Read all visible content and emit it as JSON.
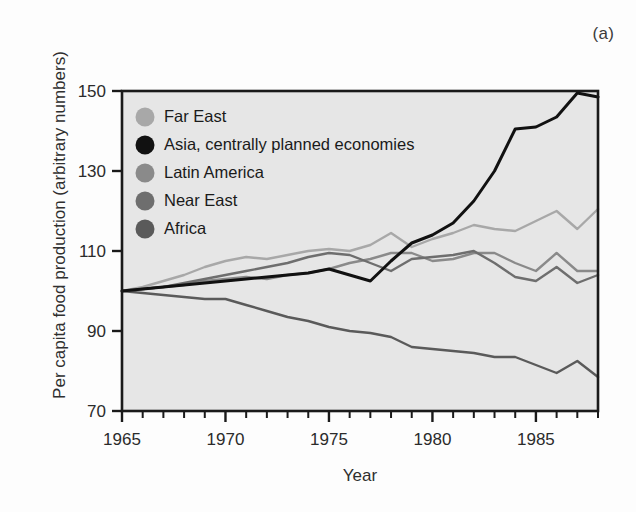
{
  "figure": {
    "panel_label": "(a)",
    "background_color": "#fdfdfd",
    "plot_background_color": "#e6e6e6",
    "axis_color": "#1a1a1a"
  },
  "chart_data": {
    "type": "line",
    "title": "",
    "subtitle": "",
    "xlabel": "Year",
    "ylabel": "Per capita food production (arbitrary numbers)",
    "xlim": [
      1965,
      1988
    ],
    "ylim": [
      70,
      150
    ],
    "xticks": [
      1965,
      1966,
      1967,
      1968,
      1969,
      1970,
      1971,
      1972,
      1973,
      1974,
      1975,
      1976,
      1977,
      1978,
      1979,
      1980,
      1981,
      1982,
      1983,
      1984,
      1985,
      1986,
      1987,
      1988
    ],
    "xtick_labels": [
      "1965",
      "",
      "",
      "",
      "",
      "1970",
      "",
      "",
      "",
      "",
      "1975",
      "",
      "",
      "",
      "",
      "1980",
      "",
      "",
      "",
      "",
      "1985",
      "",
      "",
      ""
    ],
    "xtick_labeled": [
      1965,
      1970,
      1975,
      1980,
      1985
    ],
    "yticks": [
      70,
      90,
      110,
      130,
      150
    ],
    "ytick_labels": [
      "70",
      "90",
      "110",
      "130",
      "150"
    ],
    "grid": false,
    "legend_position": "top-left",
    "x": [
      1965,
      1966,
      1967,
      1968,
      1969,
      1970,
      1971,
      1972,
      1973,
      1974,
      1975,
      1976,
      1977,
      1978,
      1979,
      1980,
      1981,
      1982,
      1983,
      1984,
      1985,
      1986,
      1987,
      1988
    ],
    "series": [
      {
        "name": "Far East",
        "color": "#a8a8a8",
        "values": [
          100,
          101,
          102.5,
          104,
          106,
          107.5,
          108.5,
          108,
          109,
          110,
          110.5,
          110,
          111.5,
          114.5,
          111,
          113,
          114.5,
          116.5,
          115.5,
          115,
          117.5,
          120,
          115.5,
          120.5
        ]
      },
      {
        "name": "Asia, centrally planned economies",
        "color": "#111111",
        "values": [
          100,
          100.5,
          101,
          101.5,
          102,
          102.5,
          103,
          103.5,
          104,
          104.5,
          105.5,
          104,
          102.5,
          107.5,
          112,
          114,
          117,
          122.5,
          130,
          140.5,
          141,
          143.5,
          149.5,
          148.5
        ]
      },
      {
        "name": "Latin America",
        "color": "#8a8a8a",
        "values": [
          100,
          100.5,
          101,
          101.5,
          102.5,
          103,
          103.5,
          103,
          104,
          104.5,
          105.5,
          107,
          108,
          109.5,
          109.5,
          107.5,
          108,
          109.5,
          109.5,
          107,
          105,
          109.5,
          105,
          105
        ]
      },
      {
        "name": "Near East",
        "color": "#6e6e6e",
        "values": [
          100,
          100.5,
          101,
          102,
          103,
          104,
          105,
          106,
          107,
          108.5,
          109.5,
          109,
          107,
          105,
          108,
          108.5,
          109,
          110,
          107,
          103.5,
          102.5,
          106,
          102,
          104
        ]
      },
      {
        "name": "Africa",
        "color": "#5a5a5a",
        "values": [
          100,
          99.5,
          99,
          98.5,
          98,
          98,
          96.5,
          95,
          93.5,
          92.5,
          91,
          90,
          89.5,
          88.5,
          86,
          85.5,
          85,
          84.5,
          83.5,
          83.5,
          81.5,
          79.5,
          82.5,
          78.5
        ]
      }
    ]
  },
  "legend": {
    "items": [
      {
        "label": "Far East",
        "color": "#a8a8a8"
      },
      {
        "label": "Asia, centrally planned economies",
        "color": "#111111"
      },
      {
        "label": "Latin America",
        "color": "#8a8a8a"
      },
      {
        "label": "Near East",
        "color": "#6e6e6e"
      },
      {
        "label": "Africa",
        "color": "#5a5a5a"
      }
    ]
  }
}
